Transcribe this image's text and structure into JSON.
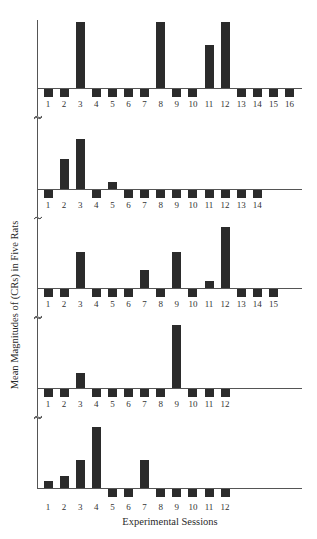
{
  "chart_data": [
    {
      "type": "bar",
      "panel": 1,
      "categories": [
        "1",
        "2",
        "3",
        "4",
        "5",
        "6",
        "7",
        "8",
        "9",
        "10",
        "11",
        "12",
        "13",
        "14",
        "15",
        "16"
      ],
      "values": [
        -1,
        -1,
        10,
        -1,
        -1,
        -1,
        -1,
        10,
        -1,
        -1,
        6.5,
        10,
        -1,
        -1,
        -1,
        -1
      ],
      "grid": false
    },
    {
      "type": "bar",
      "panel": 2,
      "categories": [
        "1",
        "2",
        "3",
        "4",
        "5",
        "6",
        "7",
        "8",
        "9",
        "10",
        "11",
        "12",
        "13",
        "14"
      ],
      "values": [
        -1,
        4.5,
        7.6,
        -1,
        1.1,
        -1,
        -1,
        -1,
        -1,
        -1,
        -1,
        -1,
        -1,
        -1
      ],
      "grid": false
    },
    {
      "type": "bar",
      "panel": 3,
      "categories": [
        "1",
        "2",
        "3",
        "4",
        "5",
        "6",
        "7",
        "8",
        "9",
        "10",
        "11",
        "12",
        "13",
        "14",
        "15"
      ],
      "values": [
        -1,
        -1,
        5.5,
        -1,
        -1,
        -1,
        2.7,
        -1,
        5.5,
        -1,
        1.0,
        9.2,
        -1,
        -1,
        -1
      ],
      "grid": false
    },
    {
      "type": "bar",
      "panel": 4,
      "categories": [
        "1",
        "2",
        "3",
        "4",
        "5",
        "6",
        "7",
        "8",
        "9",
        "10",
        "11",
        "12"
      ],
      "values": [
        -1,
        -1,
        2.3,
        -1,
        -1,
        -1,
        -1,
        -1,
        9.5,
        -1,
        -1,
        -1
      ],
      "grid": false
    },
    {
      "type": "bar",
      "panel": 5,
      "categories": [
        "1",
        "2",
        "3",
        "4",
        "5",
        "6",
        "7",
        "8",
        "9",
        "10",
        "11",
        "12"
      ],
      "values": [
        1.1,
        1.8,
        4.2,
        9.2,
        -1,
        -1,
        4.2,
        -1,
        -1,
        -1,
        -1,
        -1
      ],
      "grid": false
    }
  ],
  "labels": {
    "ylabel": "Mean Magnitudes of (CRs) in Five Rats",
    "xlabel": "Experimental Sessions"
  },
  "colors": {
    "bar": "#2b2b2b",
    "axis": "#555555"
  }
}
